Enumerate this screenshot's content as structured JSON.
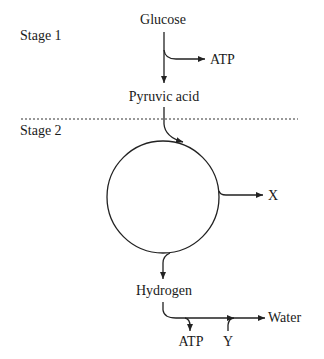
{
  "diagram": {
    "stages": [
      {
        "label": "Stage 1"
      },
      {
        "label": "Stage 2"
      }
    ],
    "nodes": {
      "glucose": "Glucose",
      "pyruvic_acid": "Pyruvic acid",
      "atp_stage1": "ATP",
      "x_product": "X",
      "hydrogen": "Hydrogen",
      "water": "Water",
      "atp_stage2": "ATP",
      "y_input": "Y"
    },
    "edges": [
      {
        "from": "Glucose",
        "to": "Pyruvic acid"
      },
      {
        "from": "Glucose",
        "to": "ATP"
      },
      {
        "from": "Pyruvic acid",
        "to": "cycle"
      },
      {
        "from": "cycle",
        "to": "X"
      },
      {
        "from": "cycle",
        "to": "Hydrogen"
      },
      {
        "from": "Hydrogen",
        "to": "Water"
      },
      {
        "from": "Hydrogen",
        "to": "ATP"
      },
      {
        "from": "Y",
        "to": "Water"
      }
    ],
    "colors": {
      "line": "#222222",
      "text": "#1a1a1a",
      "background": "#ffffff"
    }
  }
}
